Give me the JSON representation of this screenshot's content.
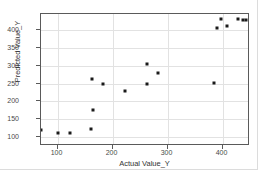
{
  "chart_data": {
    "type": "scatter",
    "title": "",
    "xlabel": "Actual Value_Y",
    "ylabel": "Predicted Value_Y",
    "xlim": [
      70,
      450
    ],
    "ylim": [
      75,
      445
    ],
    "xticks": [
      100,
      200,
      300,
      400
    ],
    "yticks": [
      100,
      150,
      200,
      250,
      300,
      350,
      400
    ],
    "xtick_labels": [
      "100",
      "200",
      "300",
      "400"
    ],
    "ytick_labels": [
      "100",
      "150",
      "200",
      "250",
      "300",
      "350",
      "400"
    ],
    "grid": true,
    "legend": "none",
    "marker": "square",
    "marker_color": "#1a1a1a",
    "grid_color": "#e2e2e2",
    "frame_color": "#5a5a5a",
    "points": [
      {
        "x": 70,
        "y": 120
      },
      {
        "x": 100,
        "y": 112
      },
      {
        "x": 122,
        "y": 111
      },
      {
        "x": 160,
        "y": 123
      },
      {
        "x": 165,
        "y": 175
      },
      {
        "x": 163,
        "y": 264
      },
      {
        "x": 183,
        "y": 250
      },
      {
        "x": 222,
        "y": 228
      },
      {
        "x": 262,
        "y": 248
      },
      {
        "x": 263,
        "y": 304
      },
      {
        "x": 283,
        "y": 281
      },
      {
        "x": 385,
        "y": 251
      },
      {
        "x": 390,
        "y": 405
      },
      {
        "x": 398,
        "y": 430
      },
      {
        "x": 408,
        "y": 412
      },
      {
        "x": 428,
        "y": 430
      },
      {
        "x": 438,
        "y": 429
      },
      {
        "x": 442,
        "y": 429
      }
    ]
  }
}
